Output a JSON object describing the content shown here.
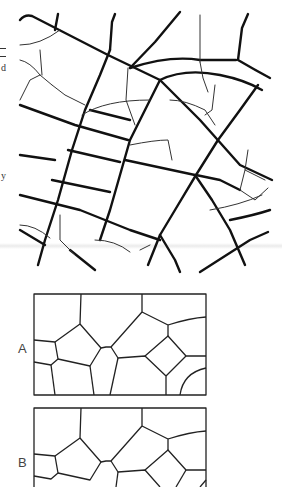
{
  "figure": {
    "type": "crack-pattern-diagram",
    "top_panel": {
      "description": "Crack network pattern with curved arcs and intersecting heavy and fine cracks"
    },
    "panels": [
      {
        "label": "A"
      },
      {
        "label": "B"
      }
    ]
  },
  "margin_fragments": [
    {
      "text": "d"
    },
    {
      "text": "y"
    }
  ],
  "colors": {
    "ink": "#111111",
    "fine_ink": "#333333",
    "background": "#ffffff"
  }
}
